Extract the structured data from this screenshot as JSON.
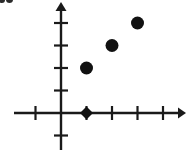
{
  "figure": {
    "width": 189,
    "height": 152,
    "background": "#ffffff",
    "ink_color": "#1a1a1a",
    "corner_artifact": {
      "present": true,
      "description": "clipped dark mark at top-left edge"
    }
  },
  "chart_data": {
    "type": "scatter",
    "title": "",
    "subtitle": "",
    "xlabel": "",
    "ylabel": "",
    "grid": false,
    "legend": null,
    "legend_position": "none",
    "xlim": [
      -2,
      5
    ],
    "ylim": [
      -1,
      5
    ],
    "xticks": [
      -1,
      1,
      2,
      3,
      4
    ],
    "yticks": [
      -1,
      1,
      2,
      3,
      4
    ],
    "xtick_labels": [],
    "ytick_labels": [],
    "axis_arrows": {
      "x_positive": true,
      "y_positive": true
    },
    "series": [
      {
        "name": "points",
        "marker": "circle",
        "color": "#111111",
        "points": [
          {
            "x": 1,
            "y": 2
          },
          {
            "x": 2,
            "y": 3
          },
          {
            "x": 3,
            "y": 4
          }
        ]
      },
      {
        "name": "axis-point",
        "marker": "diamond",
        "color": "#111111",
        "points": [
          {
            "x": 1,
            "y": 0
          }
        ]
      }
    ]
  },
  "geometry": {
    "origin_x": 61,
    "origin_y": 113,
    "x_unit": 25.5,
    "y_unit": 22.5,
    "x_axis_start": 14,
    "x_axis_end": 184,
    "y_axis_top": 2,
    "y_axis_bottom": 150,
    "tick_half_len_x": 6,
    "tick_half_len_y": 7,
    "marker_radius": 6.5,
    "diamond_radius": 6.5,
    "stroke_width": 2.4
  }
}
